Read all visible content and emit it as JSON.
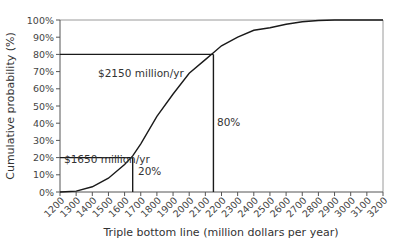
{
  "chart_data": {
    "type": "line",
    "title": "",
    "xlabel": "Triple bottom line (million dollars per year)",
    "ylabel": "Cumulative probability (%)",
    "xlim": [
      1200,
      3200
    ],
    "ylim": [
      0,
      100
    ],
    "grid": false,
    "legend": null,
    "x_ticks": [
      "1200",
      "1300",
      "1400",
      "1500",
      "1600",
      "1700",
      "1800",
      "1900",
      "2000",
      "2100",
      "2200",
      "2300",
      "2400",
      "2500",
      "2600",
      "2700",
      "2800",
      "2900",
      "3000",
      "3100",
      "3200"
    ],
    "y_ticks": [
      "0%",
      "10%",
      "20%",
      "30%",
      "40%",
      "50%",
      "60%",
      "70%",
      "80%",
      "90%",
      "100%"
    ],
    "series": [
      {
        "name": "Cumulative probability",
        "x": [
          1200,
          1300,
          1400,
          1500,
          1600,
          1650,
          1700,
          1800,
          1900,
          2000,
          2100,
          2150,
          2200,
          2300,
          2400,
          2500,
          2600,
          2700,
          2800,
          2900,
          3000,
          3100,
          3200
        ],
        "values": [
          0,
          0.5,
          3,
          8,
          16,
          21,
          28,
          44,
          57,
          69,
          77,
          81,
          85,
          90,
          94,
          95.5,
          97.5,
          99,
          99.7,
          100,
          100,
          100,
          100
        ]
      }
    ],
    "annotations": [
      {
        "text": "$1650 million/yr",
        "x": 1650,
        "y": 20,
        "type": "reference-lines"
      },
      {
        "text": "20%",
        "x": 1650,
        "y": 20,
        "type": "label"
      },
      {
        "text": "$2150 million/yr",
        "x": 2150,
        "y": 80,
        "type": "reference-lines"
      },
      {
        "text": "80%",
        "x": 2150,
        "y": 80,
        "type": "label"
      }
    ]
  },
  "labels": {
    "xlabel": "Triple bottom line (million dollars per year)",
    "ylabel": "Cumulative probability (%)",
    "annot_1650": "$1650 million/yr",
    "annot_2150": "$2150 million/yr",
    "pct_20": "20%",
    "pct_80": "80%"
  }
}
